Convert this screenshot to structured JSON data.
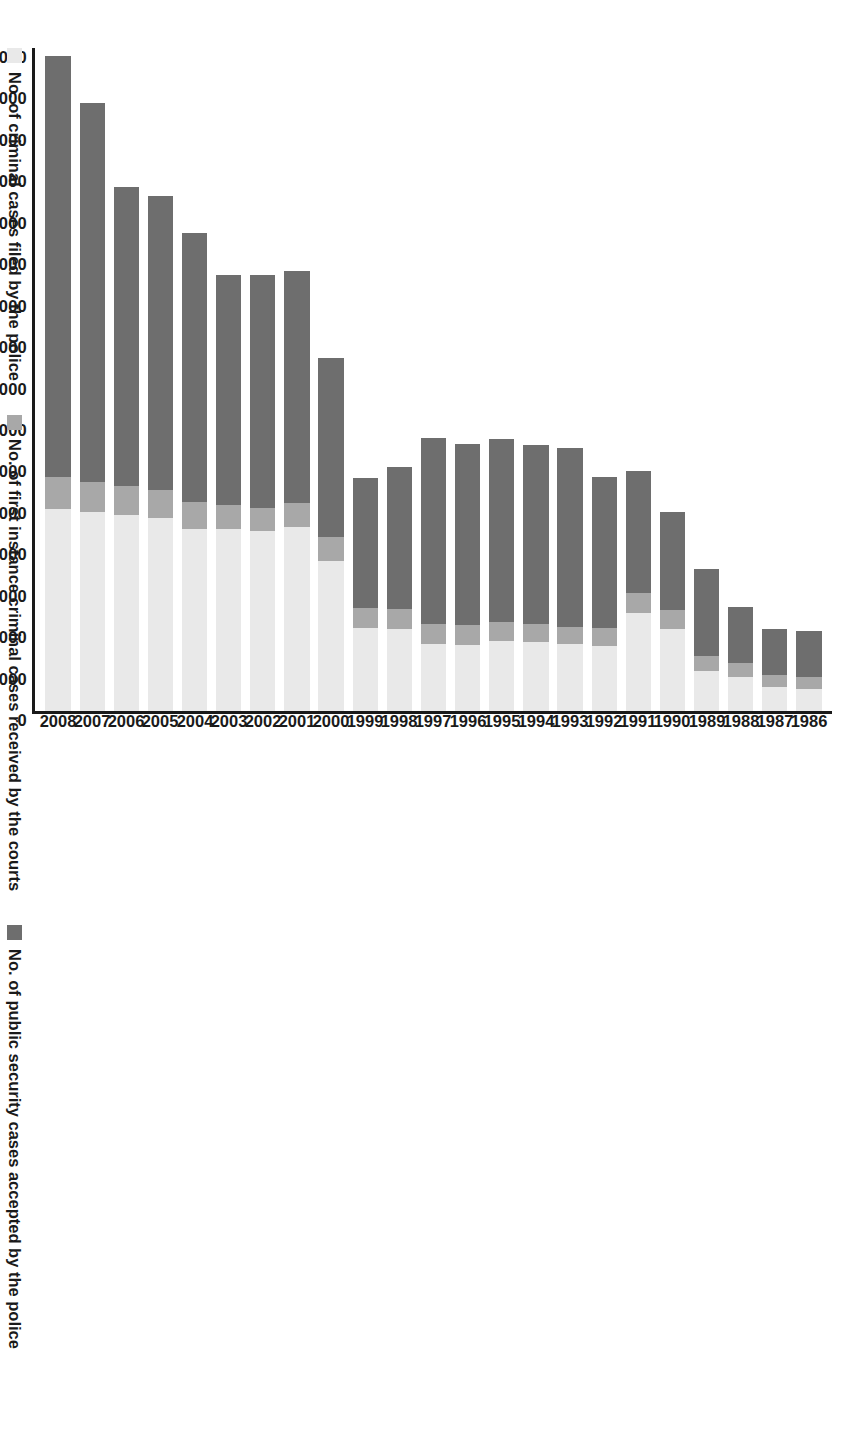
{
  "chart_data": {
    "type": "bar",
    "orientation": "vertical-rotated",
    "title": "",
    "subtitle": "",
    "xlabel": "",
    "ylabel": "",
    "grid": false,
    "stacked": true,
    "ylim": [
      0,
      16000000
    ],
    "ytick_step": 1000000,
    "categories": [
      "1986",
      "1987",
      "1988",
      "1989",
      "1990",
      "1991",
      "1992",
      "1993",
      "1994",
      "1995",
      "1996",
      "1997",
      "1998",
      "1999",
      "2000",
      "2001",
      "2002",
      "2003",
      "2004",
      "2005",
      "2006",
      "2007",
      "2008"
    ],
    "ytick_labels": [
      "16 000 000",
      "15 000 000",
      "14 000 000",
      "13 000 000",
      "12 000 000",
      "11 000 000",
      "10 000 000",
      "9 000 000",
      "8 000 000",
      "7 000 000",
      "6 000 000",
      "5 000 000",
      "4 000 000",
      "3 000 000",
      "2 000 000",
      "1 000 000",
      "0"
    ],
    "legend_position": "bottom",
    "series": [
      {
        "name": "No. of criminal cases filed by the police",
        "color": "#e9e9e9",
        "values": [
          520000,
          570000,
          830000,
          970000,
          1980000,
          2370000,
          1580000,
          1620000,
          1660000,
          1690000,
          1600000,
          1610000,
          1990000,
          2000000,
          3630000,
          4450000,
          4340000,
          4390000,
          4400000,
          4650000,
          4740000,
          4810000,
          4880000
        ]
      },
      {
        "name": "No. of first instance criminal cases received by the courts",
        "color": "#a8a8a8",
        "values": [
          310000,
          310000,
          330000,
          360000,
          460000,
          480000,
          430000,
          400000,
          430000,
          450000,
          470000,
          480000,
          480000,
          480000,
          560000,
          560000,
          560000,
          570000,
          640000,
          680000,
          700000,
          710000,
          770000
        ]
      },
      {
        "name": "No. of public security cases accepted by the police",
        "color": "#6e6e6e",
        "values": [
          1100000,
          1110000,
          1360000,
          2100000,
          2370000,
          2930000,
          3630000,
          4330000,
          4320000,
          4420000,
          4370000,
          4490000,
          3420000,
          3150000,
          4340000,
          5620000,
          5630000,
          5550000,
          6490000,
          7100000,
          7200000,
          9150000,
          10150000
        ]
      }
    ],
    "legend": [
      {
        "label": "No. of criminal cases filed by the police",
        "color": "#e9e9e9"
      },
      {
        "label": "No. of first instance criminal cases received by the courts",
        "color": "#a8a8a8"
      },
      {
        "label": "No. of public security cases accepted by the police",
        "color": "#6e6e6e"
      }
    ]
  },
  "axis": {
    "value_axis_max": 16000000,
    "value_axis_min": 0
  }
}
